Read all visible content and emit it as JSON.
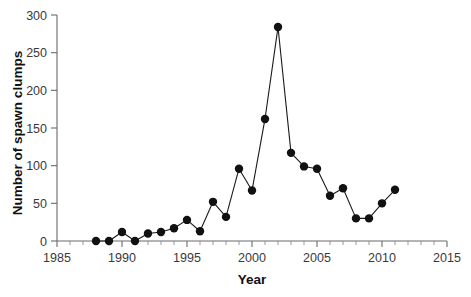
{
  "chart_data": {
    "type": "line",
    "title": "",
    "subtitle": "",
    "xlabel": "Year",
    "ylabel": "Number of spawn clumps",
    "xlim": [
      1985,
      2015
    ],
    "ylim": [
      0,
      300
    ],
    "xticks": [
      1985,
      1990,
      1995,
      2000,
      2005,
      2010,
      2015
    ],
    "xticklabels": [
      "1985",
      "1990",
      "1995",
      "2000",
      "2005",
      "2010",
      "2015"
    ],
    "x_minor_tick_step": 1,
    "yticks": [
      0,
      50,
      100,
      150,
      200,
      250,
      300
    ],
    "yticklabels": [
      "0",
      "50",
      "100",
      "150",
      "200",
      "250",
      "300"
    ],
    "grid": false,
    "legend": null,
    "marker": "circle",
    "marker_color": "#111111",
    "line_color": "#1a1a1a",
    "x": [
      1988,
      1989,
      1990,
      1991,
      1992,
      1993,
      1994,
      1995,
      1996,
      1997,
      1998,
      1999,
      2000,
      2001,
      2002,
      2003,
      2004,
      2005,
      2006,
      2007,
      2008,
      2009,
      2010,
      2011
    ],
    "values": [
      0,
      0,
      12,
      0,
      10,
      12,
      17,
      28,
      13,
      52,
      32,
      96,
      67,
      162,
      284,
      117,
      99,
      96,
      60,
      70,
      30,
      30,
      50,
      68
    ],
    "series": [
      {
        "name": "Number of spawn clumps",
        "x": [
          1988,
          1989,
          1990,
          1991,
          1992,
          1993,
          1994,
          1995,
          1996,
          1997,
          1998,
          1999,
          2000,
          2001,
          2002,
          2003,
          2004,
          2005,
          2006,
          2007,
          2008,
          2009,
          2010,
          2011
        ],
        "values": [
          0,
          0,
          12,
          0,
          10,
          12,
          17,
          28,
          13,
          52,
          32,
          96,
          67,
          162,
          284,
          117,
          99,
          96,
          60,
          70,
          30,
          30,
          50,
          68
        ]
      }
    ]
  },
  "axes": {
    "x_title": "Year",
    "y_title": "Number of spawn clumps"
  }
}
